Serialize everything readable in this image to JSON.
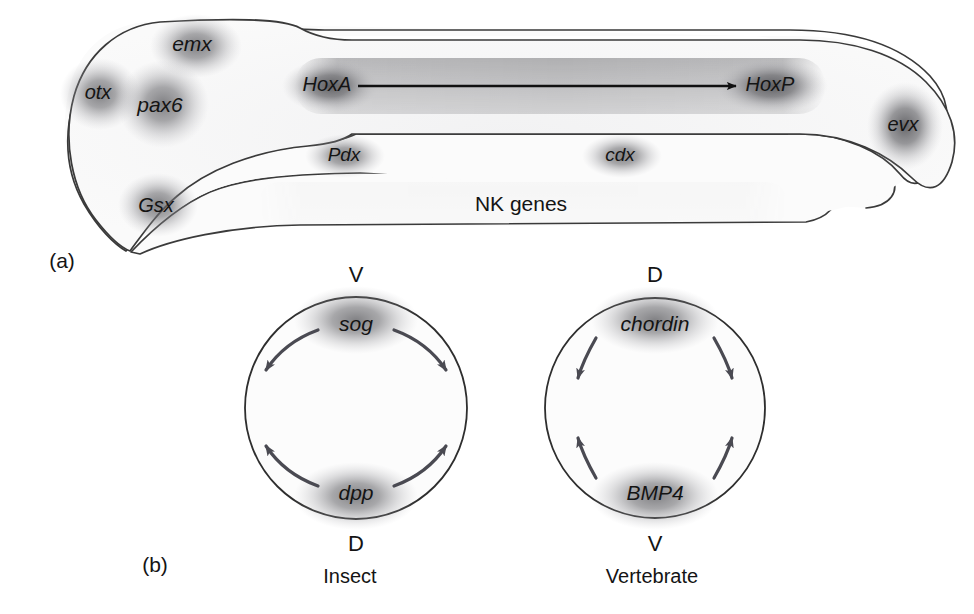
{
  "figure": {
    "background_color": "#ffffff",
    "ink_color": "#1a1a1a",
    "outline_color": "#3a3a3a",
    "expression_blob_color": "#6f6f72",
    "arrow_color": "#4a4a52"
  },
  "panels": [
    {
      "id": "a",
      "label": "(a)",
      "x": 62,
      "y": 262
    },
    {
      "id": "b",
      "label": "(b)",
      "x": 155,
      "y": 566
    }
  ],
  "panel_a": {
    "description": "Generalized bilaterian body plan showing anteroposterior and dorsoventral domains of homeobox gene expression",
    "domains": [
      {
        "name": "otx",
        "label": "otx",
        "italic": true,
        "x": 98,
        "y": 94,
        "blob": {
          "cx": 100,
          "cy": 94,
          "rx": 34,
          "ry": 30
        }
      },
      {
        "name": "emx",
        "label": "emx",
        "italic": true,
        "x": 192,
        "y": 45,
        "blob": {
          "cx": 196,
          "cy": 46,
          "rx": 40,
          "ry": 28
        }
      },
      {
        "name": "pax6",
        "label": "pax6",
        "italic": true,
        "x": 160,
        "y": 106,
        "blob": {
          "cx": 163,
          "cy": 104,
          "rx": 40,
          "ry": 38
        }
      },
      {
        "name": "Gsx",
        "label": "Gsx",
        "italic": true,
        "x": 156,
        "y": 207,
        "blob": {
          "cx": 158,
          "cy": 205,
          "rx": 34,
          "ry": 28
        }
      },
      {
        "name": "HoxA",
        "label": "HoxA",
        "italic": true,
        "x": 327,
        "y": 86,
        "blob": {
          "cx": 330,
          "cy": 86,
          "rx": 45,
          "ry": 25
        }
      },
      {
        "name": "HoxP",
        "label": "HoxP",
        "italic": true,
        "x": 768,
        "y": 86,
        "blob": {
          "cx": 770,
          "cy": 86,
          "rx": 52,
          "ry": 25
        }
      },
      {
        "name": "evx",
        "label": "evx",
        "italic": true,
        "x": 903,
        "y": 126,
        "blob": {
          "cx": 905,
          "cy": 126,
          "rx": 33,
          "ry": 38
        }
      },
      {
        "name": "Pdx",
        "label": "Pdx",
        "italic": true,
        "x": 344,
        "y": 156,
        "blob": {
          "cx": 345,
          "cy": 156,
          "rx": 36,
          "ry": 20
        }
      },
      {
        "name": "cdx",
        "label": "cdx",
        "italic": true,
        "x": 620,
        "y": 156,
        "blob": {
          "cx": 622,
          "cy": 156,
          "rx": 36,
          "ry": 20
        }
      },
      {
        "name": "NK genes",
        "label": "NK genes",
        "italic": false,
        "x": 521,
        "y": 205,
        "blob": {
          "cx": 525,
          "cy": 203,
          "rx": 270,
          "ry": 22
        }
      }
    ],
    "axis_arrow": {
      "name": "hox-cluster-axis-arrow",
      "from_label": "HoxA",
      "to_label": "HoxP",
      "x1": 358,
      "x2": 736,
      "y": 86
    }
  },
  "panel_b": {
    "description": "Dorsoventral axis inversion between insect and vertebrate: homologous antagonists sog/dpp and chordin/BMP4 occupy inverted positions",
    "diagrams": [
      {
        "id": "insect",
        "caption": "Insect",
        "caption_x": 350,
        "caption_y": 578,
        "center": {
          "cx": 356,
          "cy": 408
        },
        "radius": 111,
        "top_axis_letter": "V",
        "bottom_axis_letter": "D",
        "top_axis_x": 356,
        "top_axis_y": 276,
        "bottom_axis_x": 356,
        "bottom_axis_y": 545,
        "top_gene": {
          "label": "sog",
          "italic": true,
          "x": 356,
          "y": 325
        },
        "bottom_gene": {
          "label": "dpp",
          "italic": true,
          "x": 356,
          "y": 494
        },
        "arrow_style": "curved"
      },
      {
        "id": "vertebrate",
        "caption": "Vertebrate",
        "caption_x": 652,
        "caption_y": 578,
        "center": {
          "cx": 655,
          "cy": 408
        },
        "radius": 110,
        "top_axis_letter": "D",
        "bottom_axis_letter": "V",
        "top_axis_x": 655,
        "top_axis_y": 276,
        "bottom_axis_x": 655,
        "bottom_axis_y": 545,
        "top_gene": {
          "label": "chordin",
          "italic": true,
          "x": 655,
          "y": 325
        },
        "bottom_gene": {
          "label": "BMP4",
          "italic": true,
          "x": 655,
          "y": 494
        },
        "arrow_style": "straighter"
      }
    ]
  }
}
